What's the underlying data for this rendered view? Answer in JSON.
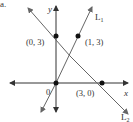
{
  "part_label": "a.",
  "axes": {
    "x_label": "x",
    "y_label": "y"
  },
  "lines": [
    {
      "name": "L1",
      "label_main": "L",
      "label_sub": "1",
      "passes_through": [
        [
          0,
          0
        ],
        [
          1,
          3
        ]
      ]
    },
    {
      "name": "L2",
      "label_main": "L",
      "label_sub": "2",
      "passes_through": [
        [
          0,
          3
        ],
        [
          3,
          0
        ]
      ]
    }
  ],
  "points": [
    {
      "coords": [
        0,
        3
      ],
      "label": "(0, 3)"
    },
    {
      "coords": [
        1,
        3
      ],
      "label": "(1, 3)"
    },
    {
      "coords": [
        0,
        0
      ],
      "label": "0"
    },
    {
      "coords": [
        3,
        0
      ],
      "label": "(3, 0)"
    }
  ],
  "colors": {
    "axis": "#333333",
    "line": "#555555",
    "point": "#111111"
  }
}
